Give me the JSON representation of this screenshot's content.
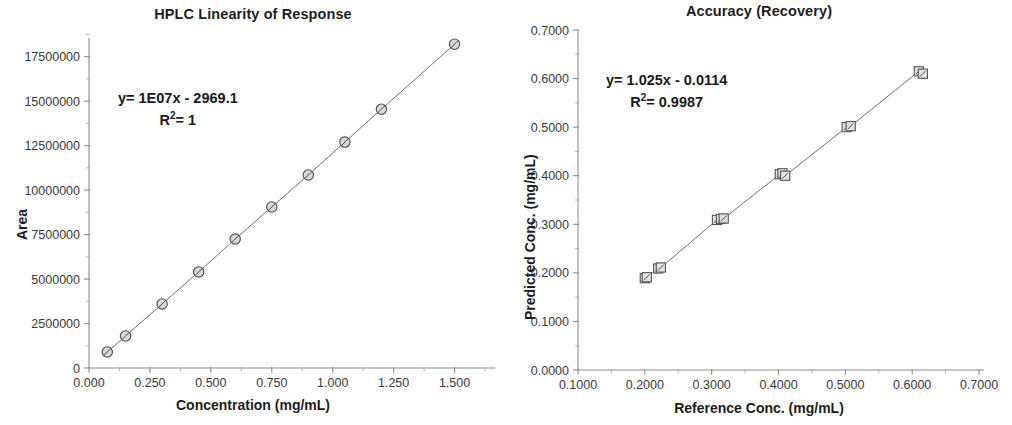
{
  "figure": {
    "background": "#ffffff",
    "ink_color": "#2b2b2b",
    "panel_count": 2
  },
  "chart_data": [
    {
      "id": "hplc-linearity",
      "type": "scatter",
      "title": "HPLC Linearity of Response",
      "xlabel": "Concentration (mg/mL)",
      "ylabel": "Area",
      "xlim": [
        0.0,
        1.625
      ],
      "ylim": [
        0,
        19000000
      ],
      "xticks": [
        0.0,
        0.25,
        0.5,
        0.75,
        1.0,
        1.25,
        1.5
      ],
      "xticklabels": [
        "0.000",
        "0.250",
        "0.500",
        "0.750",
        "1.000",
        "1.250",
        "1.500"
      ],
      "yticks": [
        0,
        2500000,
        5000000,
        7500000,
        10000000,
        12500000,
        15000000,
        17500000
      ],
      "yticklabels": [
        "0",
        "2500000",
        "5000000",
        "7500000",
        "10000000",
        "12500000",
        "15000000",
        "17500000"
      ],
      "minor_ticks": true,
      "grid": false,
      "legend": "none",
      "marker": "circle-with-slash",
      "connected": true,
      "annotations": [
        {
          "text": "y= 1E07x - 2969.1",
          "line2": "R²= 1"
        }
      ],
      "fit": {
        "equation": "y= 1E07x - 2969.1",
        "slope": "1E07",
        "intercept": "-2969.1",
        "r_squared": "1"
      },
      "x": [
        0.075,
        0.15,
        0.3,
        0.45,
        0.6,
        0.75,
        0.9,
        1.05,
        1.2,
        1.5
      ],
      "values": [
        900000,
        1800000,
        3600000,
        5400000,
        7250000,
        9050000,
        10850000,
        12700000,
        14550000,
        18200000
      ],
      "series": [
        {
          "name": "Area vs Concentration",
          "points": [
            {
              "x": 0.075,
              "y": 900000
            },
            {
              "x": 0.15,
              "y": 1800000
            },
            {
              "x": 0.3,
              "y": 3600000
            },
            {
              "x": 0.45,
              "y": 5400000
            },
            {
              "x": 0.6,
              "y": 7250000
            },
            {
              "x": 0.75,
              "y": 9050000
            },
            {
              "x": 0.9,
              "y": 10850000
            },
            {
              "x": 1.05,
              "y": 12700000
            },
            {
              "x": 1.2,
              "y": 14550000
            },
            {
              "x": 1.5,
              "y": 18200000
            }
          ]
        }
      ]
    },
    {
      "id": "accuracy-recovery",
      "type": "scatter",
      "title": "Accuracy (Recovery)",
      "xlabel": "Reference Conc. (mg/mL)",
      "ylabel": "Predicted Conc. (mg/mL)",
      "xlim": [
        0.1,
        0.7
      ],
      "ylim": [
        0.0,
        0.7
      ],
      "xticks": [
        0.1,
        0.2,
        0.3,
        0.4,
        0.5,
        0.6,
        0.7
      ],
      "xticklabels": [
        "0.1000",
        "0.2000",
        "0.3000",
        "0.4000",
        "0.5000",
        "0.6000",
        "0.7000"
      ],
      "yticks": [
        0.0,
        0.1,
        0.2,
        0.3,
        0.4,
        0.5,
        0.6,
        0.7
      ],
      "yticklabels": [
        "0.0000",
        "0.1000",
        "0.2000",
        "0.3000",
        "0.4000",
        "0.5000",
        "0.6000",
        "0.7000"
      ],
      "minor_ticks": true,
      "grid": false,
      "legend": "none",
      "marker": "square-with-slash",
      "connected": true,
      "annotations": [
        {
          "text": "y= 1.025x - 0.0114",
          "line2": "R²= 0.9987"
        }
      ],
      "fit": {
        "equation": "y= 1.025x - 0.0114",
        "slope": "1.025",
        "intercept": "-0.0114",
        "r_squared": "0.9987"
      },
      "x": [
        0.2,
        0.203,
        0.22,
        0.224,
        0.308,
        0.314,
        0.318,
        0.402,
        0.406,
        0.41,
        0.502,
        0.508,
        0.61,
        0.616
      ],
      "values": [
        0.189,
        0.191,
        0.209,
        0.211,
        0.309,
        0.311,
        0.312,
        0.403,
        0.405,
        0.4,
        0.5,
        0.502,
        0.615,
        0.61
      ],
      "series": [
        {
          "name": "Predicted vs Reference",
          "points": [
            {
              "x": 0.2,
              "y": 0.189
            },
            {
              "x": 0.203,
              "y": 0.191
            },
            {
              "x": 0.22,
              "y": 0.209
            },
            {
              "x": 0.224,
              "y": 0.211
            },
            {
              "x": 0.308,
              "y": 0.309
            },
            {
              "x": 0.314,
              "y": 0.311
            },
            {
              "x": 0.318,
              "y": 0.312
            },
            {
              "x": 0.402,
              "y": 0.403
            },
            {
              "x": 0.406,
              "y": 0.405
            },
            {
              "x": 0.41,
              "y": 0.4
            },
            {
              "x": 0.502,
              "y": 0.5
            },
            {
              "x": 0.508,
              "y": 0.502
            },
            {
              "x": 0.61,
              "y": 0.615
            },
            {
              "x": 0.616,
              "y": 0.61
            }
          ]
        }
      ]
    }
  ]
}
